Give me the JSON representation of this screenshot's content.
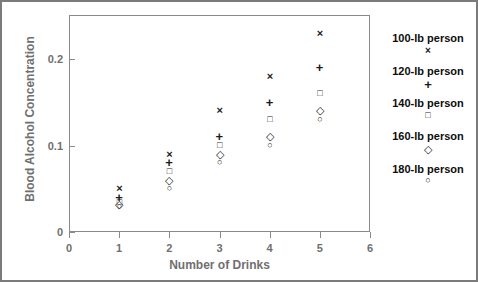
{
  "chart_data": {
    "type": "scatter",
    "title": "",
    "xlabel": "Number of Drinks",
    "ylabel": "Blood Alcohol Concentration",
    "x": [
      1,
      2,
      3,
      4,
      5
    ],
    "xlim": [
      0,
      6
    ],
    "ylim": [
      0,
      0.245
    ],
    "xticks": [
      "0",
      "1",
      "2",
      "3",
      "4",
      "5",
      "6"
    ],
    "yticks": [
      "0",
      "0.1",
      "0.2"
    ],
    "grid": false,
    "legend_position": "right",
    "series": [
      {
        "name": "100-lb person",
        "marker": "x",
        "marker_glyph": "×",
        "values": [
          0.05,
          0.09,
          0.14,
          0.18,
          0.23
        ]
      },
      {
        "name": "120-lb person",
        "marker": "plus",
        "marker_glyph": "+",
        "values": [
          0.04,
          0.08,
          0.11,
          0.15,
          0.19
        ]
      },
      {
        "name": "140-lb person",
        "marker": "square",
        "marker_glyph": "□",
        "values": [
          0.034,
          0.07,
          0.1,
          0.13,
          0.16
        ]
      },
      {
        "name": "160-lb person",
        "marker": "diamond",
        "marker_glyph": "◇",
        "values": [
          0.032,
          0.06,
          0.09,
          0.11,
          0.14
        ]
      },
      {
        "name": "180-lb person",
        "marker": "circle",
        "marker_glyph": "○",
        "values": [
          0.03,
          0.05,
          0.08,
          0.1,
          0.13
        ]
      }
    ]
  },
  "axis": {
    "xlabel": "Number of Drinks",
    "ylabel": "Blood Alcohol Concentration",
    "xticks": [
      "0",
      "1",
      "2",
      "3",
      "4",
      "5",
      "6"
    ],
    "yticks": [
      "0",
      "0.1",
      "0.2"
    ]
  },
  "legend": {
    "entries": [
      {
        "label": "100-lb person",
        "glyph": "×"
      },
      {
        "label": "120-lb person",
        "glyph": "+"
      },
      {
        "label": "140-lb person",
        "glyph": "□"
      },
      {
        "label": "160-lb person",
        "glyph": "◇"
      },
      {
        "label": "180-lb person",
        "glyph": "○"
      }
    ]
  },
  "colors": {
    "marker": "#1a1a1a",
    "axis_text": "#6f6f6f",
    "axis_line": "#8a8a8a",
    "frame": "#7b7b7b",
    "legend_text": "#0d0d0d"
  }
}
